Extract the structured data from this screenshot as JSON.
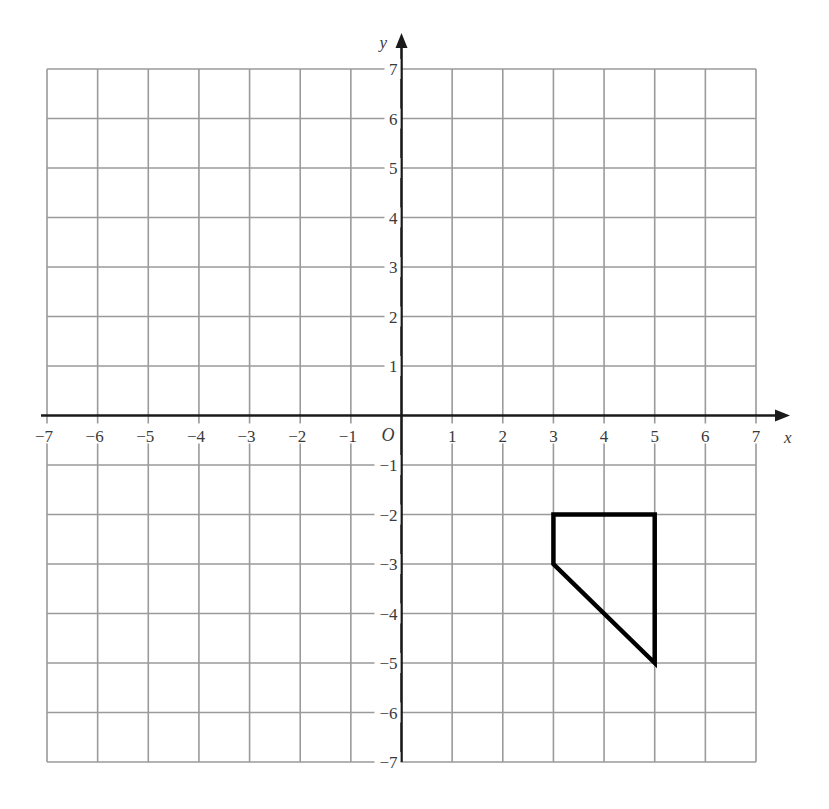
{
  "diagram": {
    "type": "coordinate-grid",
    "x_axis": {
      "label": "x",
      "min": -7,
      "max": 7,
      "ticks": [
        -7,
        -6,
        -5,
        -4,
        -3,
        -2,
        -1,
        1,
        2,
        3,
        4,
        5,
        6,
        7
      ],
      "tick_labels": [
        "−7",
        "−6",
        "−5",
        "−4",
        "−3",
        "−2",
        "−1",
        "1",
        "2",
        "3",
        "4",
        "5",
        "6",
        "7"
      ]
    },
    "y_axis": {
      "label": "y",
      "min": -7,
      "max": 7,
      "ticks": [
        7,
        6,
        5,
        4,
        3,
        2,
        1,
        -1,
        -2,
        -3,
        -4,
        -5,
        -6,
        -7
      ],
      "tick_labels": [
        "7",
        "6",
        "5",
        "4",
        "3",
        "2",
        "1",
        "−1",
        "−2",
        "−3",
        "−4",
        "−5",
        "−6",
        "−7"
      ]
    },
    "origin_label": "O",
    "shape": {
      "name": "quadrilateral",
      "vertices": [
        [
          3,
          -2
        ],
        [
          5,
          -2
        ],
        [
          5,
          -5
        ],
        [
          3,
          -3
        ]
      ]
    },
    "colors": {
      "grid": "#9a9a9a",
      "axis": "#1a1a1a",
      "shape": "#000000",
      "label": "#3a3a3a"
    }
  }
}
